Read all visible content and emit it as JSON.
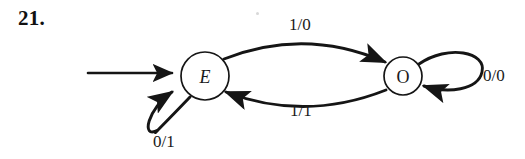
{
  "figure": {
    "exercise_number": "21.",
    "background_color": "#ffffff",
    "ink_color": "#151515"
  },
  "states": [
    {
      "id": "E",
      "label": "E",
      "style": "italic",
      "cx": 205,
      "cy": 76,
      "r": 24,
      "is_start": true
    },
    {
      "id": "O",
      "label": "O",
      "style": "upright",
      "cx": 403,
      "cy": 76,
      "r": 19,
      "is_start": false
    }
  ],
  "transitions": [
    {
      "from": "E",
      "to": "O",
      "label": "1/0",
      "input": "1",
      "output": "0",
      "shape": "arc-above"
    },
    {
      "from": "O",
      "to": "E",
      "label": "1/1",
      "input": "1",
      "output": "1",
      "shape": "arc-below"
    },
    {
      "from": "E",
      "to": "E",
      "label": "0/1",
      "input": "0",
      "output": "1",
      "shape": "self-loop-lower-left"
    },
    {
      "from": "O",
      "to": "O",
      "label": "0/0",
      "input": "0",
      "output": "0",
      "shape": "self-loop-right"
    }
  ],
  "start_arrow": {
    "name": "start-arrow",
    "from_x": 88,
    "to_x": 180,
    "y": 73
  }
}
